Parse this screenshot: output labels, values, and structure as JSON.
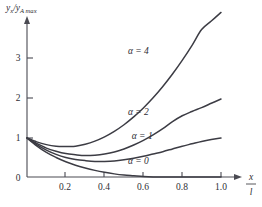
{
  "chart_data": {
    "type": "line",
    "title": "",
    "subtitle": "",
    "ylabel": "y_x / y_A max",
    "ylabel_parts": {
      "num_var": "y",
      "num_sub": "x",
      "den_var": "y",
      "den_sub": "A max",
      "separator": "/"
    },
    "xlabel": "x / l",
    "xlabel_parts": {
      "numerator": "x",
      "denominator": "l"
    },
    "origin_label": "0",
    "xticks": [
      0.2,
      0.4,
      0.6,
      0.8,
      1.0
    ],
    "xticklabels": [
      "0.2",
      "0.4",
      "0.6",
      "0.8",
      "1.0"
    ],
    "yticks": [
      1,
      2,
      3
    ],
    "yticklabels": [
      "1",
      "2",
      "3"
    ],
    "xlim": [
      0.0,
      1.07
    ],
    "ylim": [
      0.0,
      4.35
    ],
    "grid": false,
    "legend_position": "inline-annotations",
    "series": [
      {
        "name": "alpha = 4",
        "label": "α = 4",
        "label_x": 0.52,
        "label_y": 3.16,
        "x": [
          0.0,
          0.05,
          0.1,
          0.15,
          0.2,
          0.22,
          0.25,
          0.3,
          0.35,
          0.4,
          0.45,
          0.5,
          0.55,
          0.6,
          0.65,
          0.7,
          0.75,
          0.8,
          0.85,
          0.9,
          0.95,
          1.0
        ],
        "values": [
          1.0,
          0.9,
          0.83,
          0.79,
          0.78,
          0.78,
          0.79,
          0.84,
          0.92,
          1.03,
          1.17,
          1.34,
          1.54,
          1.77,
          2.03,
          2.32,
          2.64,
          2.99,
          3.37,
          3.78,
          4.0,
          4.22
        ]
      },
      {
        "name": "alpha = 2",
        "label": "α = 2",
        "label_x": 0.52,
        "label_y": 1.58,
        "x": [
          0.0,
          0.05,
          0.1,
          0.15,
          0.2,
          0.25,
          0.3,
          0.35,
          0.4,
          0.45,
          0.5,
          0.55,
          0.6,
          0.65,
          0.7,
          0.75,
          0.8,
          0.85,
          0.9,
          0.95,
          1.0
        ],
        "values": [
          1.0,
          0.86,
          0.74,
          0.66,
          0.6,
          0.57,
          0.55,
          0.56,
          0.59,
          0.64,
          0.72,
          0.82,
          0.94,
          1.08,
          1.24,
          1.42,
          1.57,
          1.68,
          1.78,
          1.89,
          2.0
        ]
      },
      {
        "name": "alpha = 1",
        "label": "α = 1",
        "label_x": 0.54,
        "label_y": 0.98,
        "x": [
          0.0,
          0.05,
          0.1,
          0.15,
          0.2,
          0.25,
          0.3,
          0.35,
          0.4,
          0.45,
          0.5,
          0.55,
          0.6,
          0.65,
          0.7,
          0.75,
          0.8,
          0.85,
          0.9,
          0.95,
          1.0
        ],
        "values": [
          1.0,
          0.83,
          0.69,
          0.58,
          0.5,
          0.45,
          0.42,
          0.4,
          0.4,
          0.41,
          0.44,
          0.48,
          0.53,
          0.59,
          0.65,
          0.72,
          0.79,
          0.85,
          0.91,
          0.96,
          1.0
        ]
      },
      {
        "name": "alpha = 0",
        "label": "α = 0",
        "label_x": 0.52,
        "label_y": 0.34,
        "x": [
          0.0,
          0.05,
          0.1,
          0.15,
          0.2,
          0.25,
          0.3,
          0.35,
          0.4,
          0.45,
          0.5,
          0.55,
          0.6,
          0.65,
          0.7,
          0.8,
          0.9,
          1.0
        ],
        "values": [
          1.0,
          0.8,
          0.63,
          0.5,
          0.39,
          0.3,
          0.23,
          0.17,
          0.12,
          0.08,
          0.05,
          0.03,
          0.01,
          0.0,
          0.0,
          0.0,
          0.0,
          0.0
        ]
      }
    ],
    "colors": {
      "curve": "#3c3c44",
      "axis": "#4a4a52",
      "text": "#2e2e34",
      "background": "#ffffff"
    }
  }
}
